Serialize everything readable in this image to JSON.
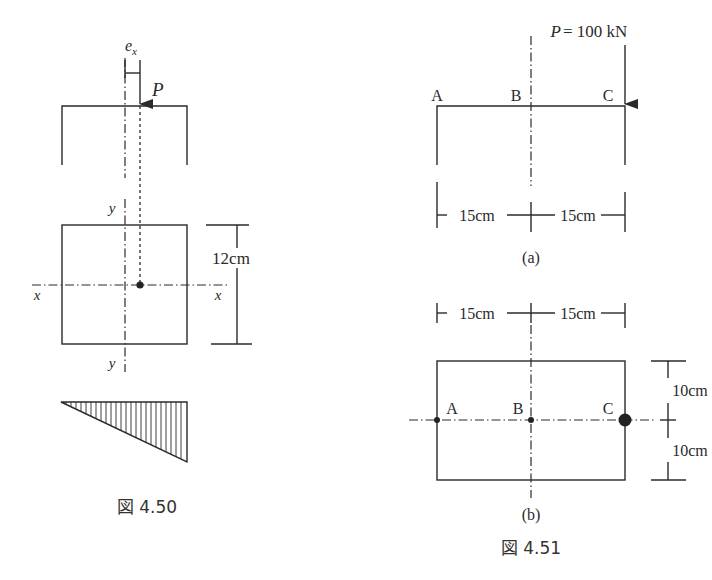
{
  "figure_450": {
    "caption": "図 4.50",
    "eccentricity_label": "e",
    "eccentricity_subscript": "x",
    "load_label": "P",
    "axis_x_left": "x",
    "axis_x_right": "x",
    "axis_y_top": "y",
    "axis_y_bottom": "y",
    "height_dimension": "12cm"
  },
  "figure_451": {
    "caption": "図 4.51",
    "sub_a": {
      "label": "(a)",
      "load_label": "P = 100 kN",
      "points": [
        "A",
        "B",
        "C"
      ],
      "dim_left": "15cm",
      "dim_right": "15cm"
    },
    "sub_b": {
      "label": "(b)",
      "points": [
        "A",
        "B",
        "C"
      ],
      "dim_left": "15cm",
      "dim_right": "15cm",
      "dim_top": "10cm",
      "dim_bottom": "10cm"
    }
  }
}
